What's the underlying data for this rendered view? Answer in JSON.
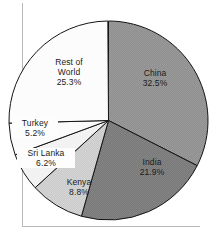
{
  "chart": {
    "title": ""
  },
  "chart_data": {
    "type": "pie",
    "title": "",
    "subtitle": "",
    "xlabel": "",
    "ylabel": "",
    "legend_position": "none",
    "grid": false,
    "units": "percent",
    "total": 99.9,
    "start_angle_deg": 0,
    "direction": "clockwise",
    "categories": [
      "China",
      "India",
      "Kenya",
      "Sri Lanka",
      "Turkey",
      "Rest of World"
    ],
    "values": [
      32.5,
      21.9,
      8.8,
      6.2,
      5.2,
      25.3
    ],
    "slices": [
      {
        "name": "China",
        "value": 32.5,
        "label": "China",
        "value_label": "32.5%",
        "color": "#8d8d8d",
        "start_deg": 0.0,
        "end_deg": 117.0
      },
      {
        "name": "India",
        "value": 21.9,
        "label": "India",
        "value_label": "21.9%",
        "color": "#777777",
        "start_deg": 117.0,
        "end_deg": 195.8
      },
      {
        "name": "Kenya",
        "value": 8.8,
        "label": "Kenya",
        "value_label": "8.8%",
        "color": "#c9c9c9",
        "start_deg": 195.8,
        "end_deg": 227.5
      },
      {
        "name": "Sri Lanka",
        "value": 6.2,
        "label": "Sri Lanka",
        "value_label": "6.2%",
        "color": "#f2f2f2",
        "start_deg": 227.5,
        "end_deg": 249.8
      },
      {
        "name": "Turkey",
        "value": 5.2,
        "label": "Turkey",
        "value_label": "5.2%",
        "color": "#fbfbfb",
        "start_deg": 249.8,
        "end_deg": 268.5
      },
      {
        "name": "Rest of World",
        "value": 25.3,
        "label": "Rest of World",
        "value_label": "25.3%",
        "color": "#fcfcfc",
        "start_deg": 268.5,
        "end_deg": 359.6
      }
    ]
  },
  "labels": {
    "rest_of_world": {
      "line1": "Rest of",
      "line2": "World",
      "value": "25.3%"
    },
    "china": {
      "name": "China",
      "value": "32.5%"
    },
    "india": {
      "name": "India",
      "value": "21.9%"
    },
    "turkey": {
      "name": "Turkey",
      "value": "5.2%"
    },
    "sri_lanka": {
      "name": "Sri Lanka",
      "value": "6.2%"
    },
    "kenya": {
      "name": "Kenya",
      "value": "8.8%"
    }
  },
  "colors": {
    "china": "#8d8d8d",
    "india": "#777777",
    "kenya": "#c9c9c9",
    "sri_lanka": "#f2f2f2",
    "turkey": "#fbfbfb",
    "rest_of_world": "#fcfcfc",
    "outline": "#151515",
    "frame": "#b9b9b9",
    "background": "#ffffff"
  }
}
